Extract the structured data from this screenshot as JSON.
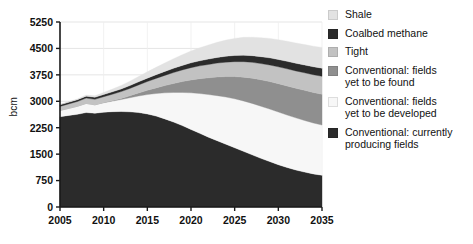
{
  "axis": {
    "ylabel": "bcm",
    "yticks": [
      0,
      750,
      1500,
      2250,
      3000,
      3750,
      4500,
      5250
    ],
    "xticks": [
      2005,
      2010,
      2015,
      2020,
      2025,
      2030,
      2035
    ]
  },
  "legend": {
    "items": [
      {
        "label": "Shale",
        "color": "#e2e2e2",
        "key": "shale"
      },
      {
        "label": "Coalbed methane",
        "color": "#2b2b2b",
        "key": "coalbed-methane"
      },
      {
        "label": "Tight",
        "color": "#c2c2c2",
        "key": "tight"
      },
      {
        "label": "Conventional: fields\nyet to be found",
        "color": "#8f8f8f",
        "key": "conventional-yet-to-be-found"
      },
      {
        "label": "Conventional: fields\nyet to be developed",
        "color": "#f7f7f7",
        "key": "conventional-yet-to-be-developed"
      },
      {
        "label": "Conventional: currently\nproducing fields",
        "color": "#2b2b2b",
        "key": "conventional-currently-producing"
      }
    ]
  },
  "chart_data": {
    "type": "area",
    "stacked": true,
    "title": "",
    "xlabel": "",
    "ylabel": "bcm",
    "xlim": [
      2005,
      2035
    ],
    "ylim": [
      0,
      5250
    ],
    "grid": true,
    "legend_position": "right",
    "x": [
      2005,
      2006,
      2007,
      2008,
      2009,
      2010,
      2011,
      2012,
      2013,
      2014,
      2015,
      2016,
      2017,
      2018,
      2019,
      2020,
      2021,
      2022,
      2023,
      2024,
      2025,
      2026,
      2027,
      2028,
      2029,
      2030,
      2031,
      2032,
      2033,
      2034,
      2035
    ],
    "stack_order_bottom_to_top": [
      "Conventional: currently producing fields",
      "Conventional: fields yet to be developed",
      "Conventional: fields yet to be found",
      "Tight",
      "Coalbed methane",
      "Shale"
    ],
    "series": [
      {
        "name": "Conventional: currently producing fields",
        "color": "#2b2b2b",
        "values": [
          2560,
          2600,
          2630,
          2680,
          2660,
          2690,
          2705,
          2710,
          2700,
          2680,
          2640,
          2580,
          2500,
          2410,
          2310,
          2200,
          2090,
          1980,
          1880,
          1780,
          1680,
          1580,
          1480,
          1380,
          1290,
          1200,
          1120,
          1050,
          990,
          940,
          900
        ]
      },
      {
        "name": "Conventional: fields yet to be developed",
        "color": "#f7f7f7",
        "values": [
          180,
          200,
          230,
          260,
          240,
          270,
          300,
          340,
          400,
          470,
          550,
          640,
          740,
          840,
          940,
          1040,
          1130,
          1210,
          1280,
          1340,
          1390,
          1430,
          1460,
          1480,
          1490,
          1495,
          1490,
          1480,
          1465,
          1445,
          1425
        ]
      },
      {
        "name": "Conventional: fields yet to be found",
        "color": "#8f8f8f",
        "values": [
          0,
          0,
          0,
          0,
          0,
          5,
          15,
          30,
          55,
          85,
          120,
          160,
          205,
          255,
          310,
          365,
          420,
          475,
          530,
          580,
          630,
          675,
          715,
          750,
          780,
          805,
          825,
          840,
          855,
          865,
          875
        ]
      },
      {
        "name": "Tight",
        "color": "#c2c2c2",
        "values": [
          115,
          125,
          135,
          150,
          155,
          165,
          180,
          195,
          210,
          230,
          250,
          270,
          290,
          310,
          330,
          350,
          365,
          380,
          395,
          410,
          425,
          440,
          450,
          460,
          470,
          478,
          486,
          492,
          498,
          504,
          510
        ]
      },
      {
        "name": "Coalbed methane",
        "color": "#2b2b2b",
        "values": [
          45,
          48,
          52,
          56,
          58,
          62,
          68,
          74,
          80,
          88,
          96,
          104,
          112,
          120,
          128,
          136,
          144,
          152,
          160,
          168,
          176,
          183,
          190,
          196,
          202,
          208,
          213,
          218,
          222,
          226,
          230
        ]
      },
      {
        "name": "Shale",
        "color": "#e2e2e2",
        "values": [
          10,
          14,
          20,
          30,
          42,
          58,
          78,
          100,
          125,
          152,
          180,
          210,
          240,
          272,
          304,
          336,
          368,
          400,
          430,
          458,
          484,
          506,
          524,
          540,
          552,
          562,
          570,
          576,
          580,
          584,
          588
        ]
      }
    ]
  }
}
